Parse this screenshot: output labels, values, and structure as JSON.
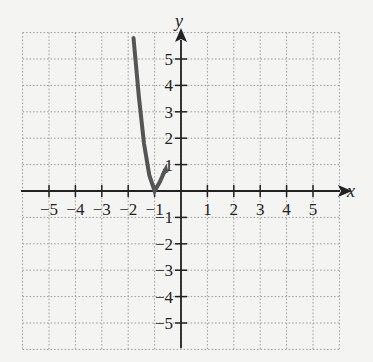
{
  "chart_data": {
    "type": "line",
    "title": "",
    "xlabel": "x",
    "ylabel": "y",
    "xlim": [
      -6,
      6
    ],
    "ylim": [
      -6,
      6
    ],
    "grid": true,
    "x_ticks": [
      -5,
      -4,
      -3,
      -2,
      -1,
      1,
      2,
      3,
      4,
      5
    ],
    "y_ticks": [
      -5,
      -4,
      -3,
      -2,
      -1,
      1,
      2,
      3,
      4,
      5
    ],
    "series": [
      {
        "name": "curve",
        "color": "#555555",
        "points": [
          [
            -1.8,
            5.8
          ],
          [
            -1.6,
            3.6
          ],
          [
            -1.4,
            1.8
          ],
          [
            -1.2,
            0.6
          ],
          [
            -1.0,
            0.0
          ],
          [
            -0.8,
            0.35
          ],
          [
            -0.6,
            0.8
          ]
        ],
        "vertex": [
          -1,
          0
        ],
        "right_endpoint": [
          -0.55,
          0.9
        ]
      }
    ]
  },
  "labels": {
    "x_axis": "x",
    "y_axis": "y",
    "x_ticks": [
      "−5",
      "−4",
      "−3",
      "−2",
      "−1",
      "1",
      "2",
      "3",
      "4",
      "5"
    ],
    "y_ticks": [
      "5",
      "4",
      "3",
      "2",
      "1",
      "−1",
      "−2",
      "−3",
      "−4",
      "−5"
    ]
  }
}
